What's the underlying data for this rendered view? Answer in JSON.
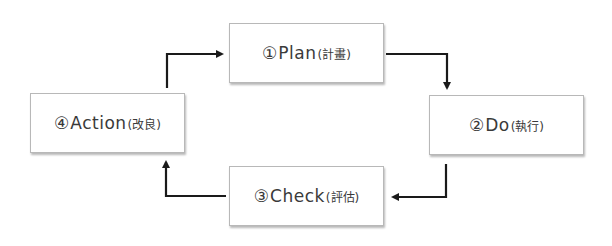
{
  "diagram": {
    "type": "PDCA cycle",
    "steps": [
      {
        "number": "①",
        "name": "Plan",
        "jp": "(計畫)"
      },
      {
        "number": "②",
        "name": "Do",
        "jp": "(執行)"
      },
      {
        "number": "③",
        "name": "Check",
        "jp": "(評估)"
      },
      {
        "number": "④",
        "name": "Action",
        "jp": "(改良)"
      }
    ],
    "flow": [
      "Plan → Do",
      "Do → Check",
      "Check → Action",
      "Action → Plan"
    ],
    "colors": {
      "box_border": "#b8b8b8",
      "arrow": "#1a1a1a",
      "text": "#3a3a3a"
    }
  }
}
